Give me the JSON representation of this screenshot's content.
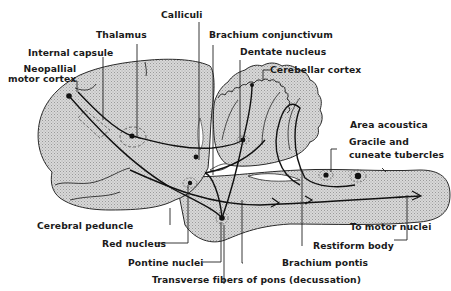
{
  "diagram": {
    "type": "anatomical-pathway-diagram",
    "colors": {
      "tissue_fill": "#cfcfcf",
      "outline": "#2a2a2a",
      "pathway": "#111111",
      "background": "#ffffff"
    },
    "labels": {
      "calliculi": "Calliculi",
      "thalamus": "Thalamus",
      "brachium_conjunctivum": "Brachium conjunctivum",
      "dentate_nucleus": "Dentate nucleus",
      "internal_capsule": "Internal capsule",
      "cerebellar_cortex": "Cerebellar cortex",
      "neopallial_line1": "Neopallial",
      "neopallial_line2": "motor cortex",
      "area_acoustica": "Area acoustica",
      "gracile_line1": "Gracile and",
      "gracile_line2": "cuneate tubercles",
      "cerebral_peduncle": "Cerebral peduncle",
      "to_motor_nuclei": "To motor nuclei",
      "red_nucleus": "Red nucleus",
      "restiform_body": "Restiform body",
      "pontine_nuclei": "Pontine nuclei",
      "brachium_pontis": "Brachium pontis",
      "transverse_fibers": "Transverse fibers of pons (decussation)"
    }
  }
}
